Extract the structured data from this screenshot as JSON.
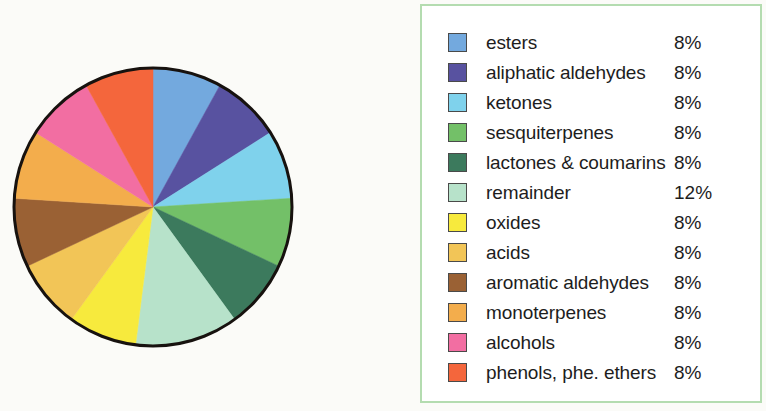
{
  "figure": {
    "background_color": "#fbfbf8"
  },
  "legend": {
    "panel_border_color": "#b4dcb0",
    "panel_background_color": "#ffffff",
    "items": [
      {
        "label": "esters",
        "value": "8%",
        "color": "#73a9de"
      },
      {
        "label": "aliphatic aldehydes",
        "value": "8%",
        "color": "#5852a0"
      },
      {
        "label": "ketones",
        "value": "8%",
        "color": "#7fd2ec"
      },
      {
        "label": "sesquiterpenes",
        "value": "8%",
        "color": "#73c068"
      },
      {
        "label": "lactones & coumarins",
        "value": "8%",
        "color": "#3c7a5d"
      },
      {
        "label": "remainder",
        "value": "12%",
        "color": "#b7e2ca"
      },
      {
        "label": "oxides",
        "value": "8%",
        "color": "#f7ea3d"
      },
      {
        "label": "acids",
        "value": "8%",
        "color": "#f2c557"
      },
      {
        "label": "aromatic aldehydes",
        "value": "8%",
        "color": "#9a6134"
      },
      {
        "label": "monoterpenes",
        "value": "8%",
        "color": "#f3ad4c"
      },
      {
        "label": "alcohols",
        "value": "8%",
        "color": "#f26ea2"
      },
      {
        "label": "phenols, phe. ethers",
        "value": "8%",
        "color": "#f4663c"
      }
    ]
  },
  "chart_data": {
    "type": "pie",
    "title": "",
    "subtitle": "",
    "xlabel": "",
    "ylabel": "",
    "grid": false,
    "legend_position": "right",
    "start_angle_deg": 0,
    "direction": "clockwise",
    "outline_color": "#17120f",
    "outline_width_px": 3,
    "center_px": [
      145,
      145
    ],
    "radius_px": 139,
    "labels": [
      "esters",
      "aliphatic aldehydes",
      "ketones",
      "sesquiterpenes",
      "lactones & coumarins",
      "remainder",
      "oxides",
      "acids",
      "aromatic aldehydes",
      "monoterpenes",
      "alcohols",
      "phenols, phe. ethers"
    ],
    "values": [
      8,
      8,
      8,
      8,
      8,
      12,
      8,
      8,
      8,
      8,
      8,
      8
    ],
    "value_labels": [
      "8%",
      "8%",
      "8%",
      "8%",
      "8%",
      "12%",
      "8%",
      "8%",
      "8%",
      "8%",
      "8%",
      "8%"
    ],
    "colors": [
      "#73a9de",
      "#5852a0",
      "#7fd2ec",
      "#73c068",
      "#3c7a5d",
      "#b7e2ca",
      "#f7ea3d",
      "#f2c557",
      "#9a6134",
      "#f3ad4c",
      "#f26ea2",
      "#f4663c"
    ],
    "units": "percent",
    "total": 100
  }
}
